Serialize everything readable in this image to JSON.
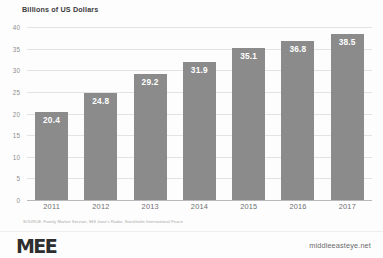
{
  "chart_data": {
    "type": "bar",
    "title": "Billions of US Dollars",
    "xlabel": "",
    "ylabel": "",
    "categories": [
      "2011",
      "2012",
      "2013",
      "2014",
      "2015",
      "2016",
      "2017"
    ],
    "values": [
      20.4,
      24.8,
      29.2,
      31.9,
      35.1,
      36.8,
      38.5
    ],
    "value_labels": [
      "20.4",
      "24.8",
      "29.2",
      "31.9",
      "35.1",
      "36.8",
      "38.5"
    ],
    "ylim": [
      0,
      40
    ],
    "yticks": [
      0,
      5,
      10,
      15,
      20,
      25,
      30,
      35,
      40
    ],
    "ytick_labels": [
      "0",
      "5",
      "10",
      "15",
      "20",
      "25",
      "30",
      "35",
      "40"
    ],
    "grid": true,
    "legend": false,
    "bar_color": "#8b8b8b",
    "gridline_color": "#e3e3e3",
    "background_color": "#ffffff"
  },
  "source": {
    "note": "SOURCE: Family Market Servian, IHS Jane's Radar, Stockholm International Peace"
  },
  "footer": {
    "logo": "MEE",
    "url": "middleeasteye.net"
  }
}
